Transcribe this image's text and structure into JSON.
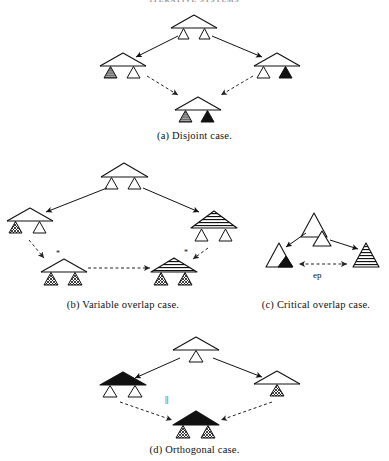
{
  "figure": {
    "running_head": "ITERATIVE SYSTEMS",
    "width": 389,
    "height": 461,
    "background": "#ffffff",
    "ink": "#000000"
  },
  "captions": {
    "a": "(a) Disjoint case.",
    "b": "(b)  Variable overlap case.",
    "c": "(c)  Critical overlap case.",
    "d": "(d) Orthogonal case."
  },
  "labels": {
    "ep": "ep",
    "parallel": "||",
    "star": "*"
  },
  "colors": {
    "solid_black": "#111111",
    "gray_fill": "#9b9b9b",
    "white_fill": "#ffffff",
    "stroke": "#111111",
    "dashed_stroke": "#333333"
  },
  "panels": [
    {
      "id": "a",
      "name": "disjoint-case",
      "caption": "(a) Disjoint case.",
      "nodes": [
        {
          "role": "root",
          "roof": "white",
          "children": [
            "white",
            "white"
          ]
        },
        {
          "role": "left",
          "roof": "white",
          "children": [
            "gray",
            "white"
          ]
        },
        {
          "role": "right",
          "roof": "white",
          "children": [
            "white",
            "black"
          ]
        },
        {
          "role": "merged",
          "roof": "white",
          "children": [
            "gray",
            "black"
          ]
        }
      ],
      "edges": [
        {
          "from": "root",
          "to": "left",
          "style": "solid-arrow"
        },
        {
          "from": "root",
          "to": "right",
          "style": "solid-arrow"
        },
        {
          "from": "left",
          "to": "merged",
          "style": "dashed-arrow"
        },
        {
          "from": "right",
          "to": "merged",
          "style": "dashed-arrow"
        }
      ]
    },
    {
      "id": "b",
      "name": "variable-overlap-case",
      "caption": "(b)  Variable overlap case.",
      "nodes": [
        {
          "role": "root",
          "roof": "white",
          "children": [
            "white",
            "white"
          ]
        },
        {
          "role": "left",
          "roof": "white",
          "children": [
            "hatch",
            "white"
          ]
        },
        {
          "role": "right",
          "roof": "striped",
          "children": [
            "white",
            "white"
          ]
        },
        {
          "role": "merged-left",
          "roof": "white",
          "children": [
            "hatch",
            "hatch"
          ]
        },
        {
          "role": "merged-right",
          "roof": "striped",
          "children": [
            "hatch",
            "hatch"
          ]
        }
      ],
      "edges": [
        {
          "from": "root",
          "to": "left",
          "style": "solid-arrow"
        },
        {
          "from": "root",
          "to": "right",
          "style": "solid-arrow"
        },
        {
          "from": "left",
          "to": "merged-left",
          "style": "dashed-arrow",
          "marker": "*"
        },
        {
          "from": "right",
          "to": "merged-right",
          "style": "dashed-arrow",
          "marker": "*"
        },
        {
          "from": "merged-left",
          "to": "merged-right",
          "style": "dashed-arrow-horizontal"
        }
      ]
    },
    {
      "id": "c",
      "name": "critical-overlap-case",
      "caption": "(c)  Critical overlap case.",
      "nodes": [
        {
          "role": "top",
          "shape": "triangle-white-with-small-white-triangle"
        },
        {
          "role": "left",
          "shape": "triangle-white-with-small-black-corner"
        },
        {
          "role": "right",
          "shape": "triangle-striped"
        }
      ],
      "edges": [
        {
          "from": "top",
          "to": "left",
          "style": "solid-arrow"
        },
        {
          "from": "top",
          "to": "right",
          "style": "solid-arrow"
        },
        {
          "from": "left",
          "to": "right",
          "style": "dashed-double-arrow",
          "label": "ep"
        }
      ]
    },
    {
      "id": "d",
      "name": "orthogonal-case",
      "caption": "(d) Orthogonal case.",
      "nodes": [
        {
          "role": "root",
          "roof": "white",
          "children": [
            "white"
          ]
        },
        {
          "role": "left",
          "roof": "black",
          "children": [
            "white",
            "white"
          ]
        },
        {
          "role": "right",
          "roof": "white",
          "children": [
            "hatch"
          ]
        },
        {
          "role": "merged",
          "roof": "black",
          "children": [
            "hatch",
            "hatch"
          ]
        }
      ],
      "edges": [
        {
          "from": "root",
          "to": "left",
          "style": "solid-arrow"
        },
        {
          "from": "root",
          "to": "right",
          "style": "solid-arrow"
        },
        {
          "from": "left",
          "to": "merged",
          "style": "dashed-arrow",
          "marker": "||"
        },
        {
          "from": "right",
          "to": "merged",
          "style": "dashed-arrow"
        }
      ]
    }
  ]
}
